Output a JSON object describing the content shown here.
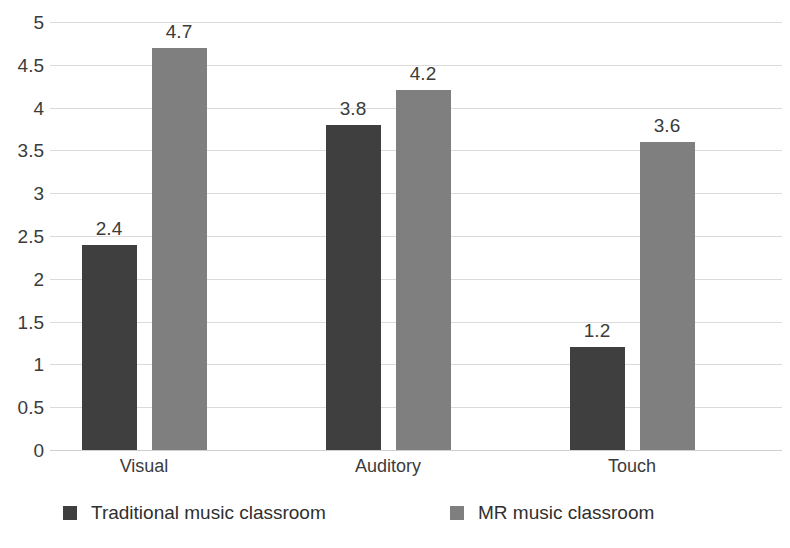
{
  "chart_data": {
    "type": "bar",
    "title": "",
    "subtitle": "",
    "xlabel": "",
    "ylabel": "",
    "categories": [
      "Visual",
      "Auditory",
      "Touch"
    ],
    "series": [
      {
        "name": "Traditional music classroom",
        "color": "#3f3f3f",
        "values": [
          2.4,
          3.8,
          1.2
        ]
      },
      {
        "name": "MR music classroom",
        "color": "#7f7f7f",
        "values": [
          4.7,
          4.2,
          3.6
        ]
      }
    ],
    "ylim": [
      0,
      5
    ],
    "ytick_step": 0.5,
    "ytick_labels": [
      "5",
      "4.5",
      "4",
      "3.5",
      "3",
      "2.5",
      "2",
      "1.5",
      "1",
      "0.5",
      "0"
    ],
    "ytick_values": [
      5,
      4.5,
      4,
      3.5,
      3,
      2.5,
      2,
      1.5,
      1,
      0.5,
      0
    ],
    "data_labels": [
      [
        "2.4",
        "3.8",
        "1.2"
      ],
      [
        "4.7",
        "4.2",
        "3.6"
      ]
    ],
    "grid": true,
    "grid_color": "#dbdbdb",
    "legend_position": "bottom",
    "background": "#ffffff"
  },
  "legend": {
    "items": [
      {
        "label": "Traditional music classroom",
        "color": "#3f3f3f"
      },
      {
        "label": "MR music classroom",
        "color": "#7f7f7f"
      }
    ]
  }
}
